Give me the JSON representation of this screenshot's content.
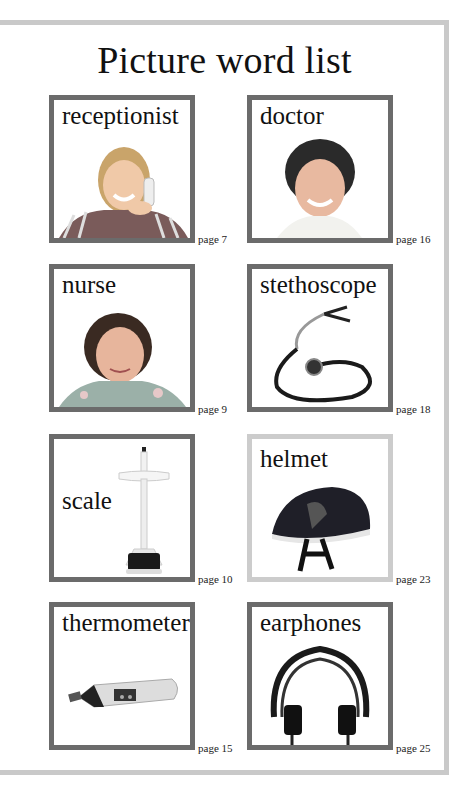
{
  "title": "Picture word list",
  "colors": {
    "frame": "#c9c9c9",
    "card_border": "#6b6b6b",
    "card_border_light": "#cccccc"
  },
  "cards": [
    {
      "word": "receptionist",
      "page": "page 7",
      "icon": "receptionist-photo"
    },
    {
      "word": "doctor",
      "page": "page 16",
      "icon": "doctor-photo"
    },
    {
      "word": "nurse",
      "page": "page 9",
      "icon": "nurse-photo"
    },
    {
      "word": "stethoscope",
      "page": "page 18",
      "icon": "stethoscope-photo"
    },
    {
      "word": "scale",
      "page": "page 10",
      "icon": "scale-photo"
    },
    {
      "word": "helmet",
      "page": "page 23",
      "icon": "helmet-photo"
    },
    {
      "word": "thermometer",
      "page": "page 15",
      "icon": "thermometer-photo"
    },
    {
      "word": "earphones",
      "page": "page 25",
      "icon": "earphones-photo"
    }
  ]
}
